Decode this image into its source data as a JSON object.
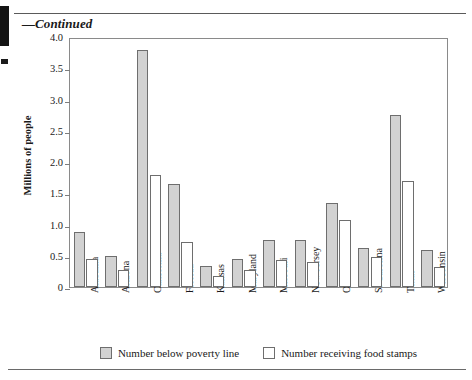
{
  "page": {
    "continued_label": "—Continued"
  },
  "chart_data": {
    "type": "bar",
    "title": "",
    "xlabel": "",
    "ylabel": "Millions of people",
    "ylim": [
      0,
      4.0
    ],
    "ytick_labels": [
      "4.0",
      "3.5",
      "3.0",
      "2.5",
      "2.0",
      "1.5",
      "1.0",
      "0.5",
      "0"
    ],
    "ytick_values": [
      4.0,
      3.5,
      3.0,
      2.5,
      2.0,
      1.5,
      1.0,
      0.5,
      0
    ],
    "grid": false,
    "legend_position": "bottom",
    "categories": [
      "Alabama",
      "Arizona",
      "California",
      "Florida",
      "Kansas",
      "Maryland",
      "Missouri",
      "New Jersey",
      "Ohio",
      "S. Carolina",
      "Texas",
      "Wisconsin"
    ],
    "series": [
      {
        "name": "Number below poverty line",
        "color": "#d2d2d2",
        "values": [
          0.88,
          0.5,
          3.8,
          1.65,
          0.33,
          0.45,
          0.75,
          0.76,
          1.35,
          0.62,
          2.76,
          0.6
        ]
      },
      {
        "name": "Number receiving food stamps",
        "color": "#ffffff",
        "values": [
          0.45,
          0.27,
          1.8,
          0.72,
          0.17,
          0.28,
          0.43,
          0.4,
          1.08,
          0.48,
          1.7,
          0.32
        ]
      }
    ]
  }
}
